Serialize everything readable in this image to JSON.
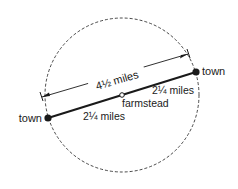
{
  "diagram": {
    "circle": {
      "cx": 122,
      "cy": 95,
      "r": 77,
      "style": "dashed"
    },
    "dimension": {
      "label": "4½ miles"
    },
    "towns": [
      {
        "label": "town",
        "x": 48,
        "y": 118
      },
      {
        "label": "town",
        "x": 196,
        "y": 72
      }
    ],
    "farmstead": {
      "label": "farmstead",
      "x": 122,
      "y": 95
    },
    "segments": [
      {
        "label": "2¼ miles"
      },
      {
        "label": "2¼ miles"
      }
    ],
    "colors": {
      "ink": "#1a1a1a",
      "background": "#ffffff"
    }
  }
}
